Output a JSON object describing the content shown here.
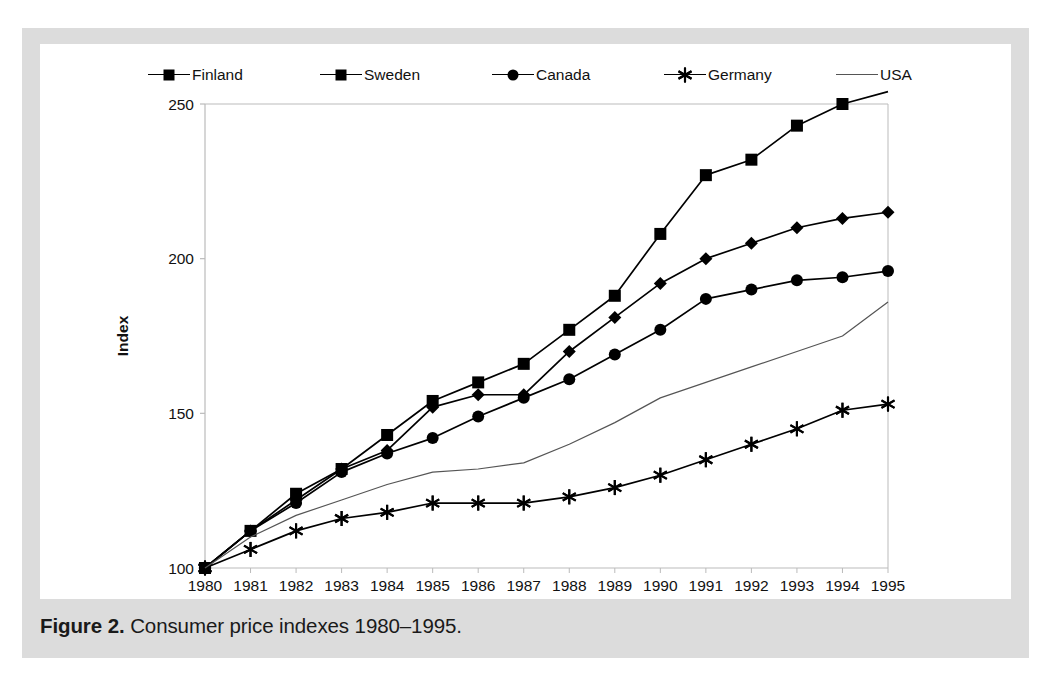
{
  "figure": {
    "caption_label": "Figure 2.",
    "caption_text": " Consumer price indexes 1980–1995."
  },
  "colors": {
    "series_line": "#000000",
    "usa_line": "#555555",
    "panel_background": "#ffffff",
    "mat_background": "#dcdcdc",
    "axis": "#bbbbbb",
    "text": "#111111"
  },
  "legend": {
    "position": "top",
    "items": [
      {
        "label": "Finland",
        "marker": "diamond-marker-icon"
      },
      {
        "label": "Sweden",
        "marker": "square-marker-icon"
      },
      {
        "label": "Canada",
        "marker": "circle-marker-icon"
      },
      {
        "label": "Germany",
        "marker": "asterisk-marker-icon"
      },
      {
        "label": "USA",
        "marker": "plain-line-icon"
      }
    ]
  },
  "axes": {
    "y_title": "Index",
    "y_ticks": [
      "100",
      "150",
      "200",
      "250"
    ],
    "x_ticks": [
      "1980",
      "1981",
      "1982",
      "1983",
      "1984",
      "1985",
      "1986",
      "1987",
      "1988",
      "1989",
      "1990",
      "1991",
      "1992",
      "1993",
      "1994",
      "1995"
    ]
  },
  "chart_data": {
    "type": "line",
    "title": "Consumer price indexes 1980–1995",
    "xlabel": "",
    "ylabel": "Index",
    "ylim": [
      100,
      250
    ],
    "xlim": [
      1980,
      1995
    ],
    "grid": false,
    "legend_position": "top",
    "x": [
      1980,
      1981,
      1982,
      1983,
      1984,
      1985,
      1986,
      1987,
      1988,
      1989,
      1990,
      1991,
      1992,
      1993,
      1994,
      1995
    ],
    "categories": [
      "1980",
      "1981",
      "1982",
      "1983",
      "1984",
      "1985",
      "1986",
      "1987",
      "1988",
      "1989",
      "1990",
      "1991",
      "1992",
      "1993",
      "1994",
      "1995"
    ],
    "series": [
      {
        "name": "Finland",
        "marker": "diamond",
        "values": [
          100,
          112,
          122,
          132,
          138,
          152,
          156,
          156,
          170,
          181,
          192,
          200,
          205,
          210,
          213,
          215
        ]
      },
      {
        "name": "Sweden",
        "marker": "square",
        "values": [
          100,
          112,
          124,
          132,
          143,
          154,
          160,
          166,
          177,
          188,
          208,
          227,
          232,
          243,
          250,
          254
        ]
      },
      {
        "name": "Canada",
        "marker": "circle",
        "values": [
          100,
          112,
          121,
          131,
          137,
          142,
          149,
          155,
          161,
          169,
          177,
          187,
          190,
          193,
          194,
          196
        ]
      },
      {
        "name": "Germany",
        "marker": "asterisk",
        "values": [
          100,
          106,
          112,
          116,
          118,
          121,
          121,
          121,
          123,
          126,
          130,
          135,
          140,
          145,
          151,
          153
        ]
      },
      {
        "name": "USA",
        "marker": "none",
        "values": [
          100,
          110,
          117,
          122,
          127,
          131,
          132,
          134,
          140,
          147,
          155,
          160,
          165,
          170,
          175,
          186
        ]
      }
    ]
  }
}
